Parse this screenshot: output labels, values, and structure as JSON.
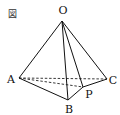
{
  "figure": {
    "caption_label": "図",
    "type": "tetrahedron",
    "vertices": {
      "O": {
        "label": "O",
        "x": 62,
        "y": 21,
        "label_x": 63,
        "label_y": 14
      },
      "A": {
        "label": "A",
        "x": 19,
        "y": 78,
        "label_x": 11,
        "label_y": 83
      },
      "B": {
        "label": "B",
        "x": 68,
        "y": 100,
        "label_x": 69,
        "label_y": 113
      },
      "C": {
        "label": "C",
        "x": 107,
        "y": 79,
        "label_x": 113,
        "label_y": 84
      },
      "P": {
        "label": "P",
        "x": 83,
        "y": 87,
        "label_x": 88,
        "label_y": 98
      }
    },
    "solid_edges": [
      "OA",
      "OB",
      "OC",
      "OP",
      "AB",
      "BP",
      "PC"
    ],
    "dashed_edges": [
      "AC",
      "AP"
    ],
    "colors": {
      "line": "#111111",
      "background": "#ffffff"
    }
  }
}
